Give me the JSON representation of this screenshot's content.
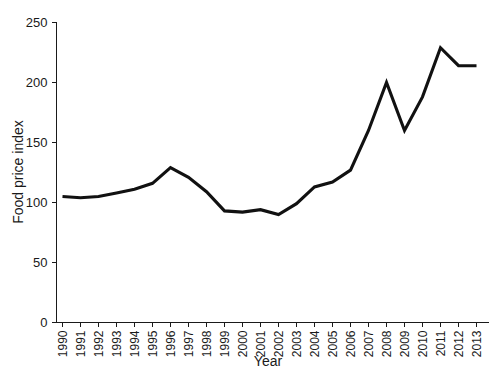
{
  "chart_data": {
    "type": "line",
    "title": "",
    "xlabel": "Year",
    "ylabel": "Food price index",
    "categories": [
      "1990",
      "1991",
      "1992",
      "1993",
      "1994",
      "1995",
      "1996",
      "1997",
      "1998",
      "1999",
      "2000",
      "2001",
      "2002",
      "2003",
      "2004",
      "2005",
      "2006",
      "2007",
      "2008",
      "2009",
      "2010",
      "2011",
      "2012",
      "2013"
    ],
    "values": [
      105,
      104,
      105,
      108,
      111,
      116,
      129,
      121,
      109,
      93,
      92,
      94,
      90,
      99,
      113,
      117,
      127,
      160,
      200,
      160,
      188,
      229,
      214,
      214
    ],
    "series": [
      {
        "name": "Food price index",
        "values": [
          105,
          104,
          105,
          108,
          111,
          116,
          129,
          121,
          109,
          93,
          92,
          94,
          90,
          99,
          113,
          117,
          127,
          160,
          200,
          160,
          188,
          229,
          214,
          214
        ]
      }
    ],
    "yticks": [
      0,
      50,
      100,
      150,
      200,
      250
    ],
    "ytick_labels": [
      "0",
      "50",
      "100",
      "150",
      "200",
      "250"
    ],
    "ylim": [
      0,
      250
    ],
    "grid": false,
    "legend": false,
    "legend_position": "none",
    "line_color": "#111111",
    "xtick_rotation": 90
  },
  "axes": {
    "y_axis_title": "Food price index",
    "x_axis_title": "Year"
  }
}
